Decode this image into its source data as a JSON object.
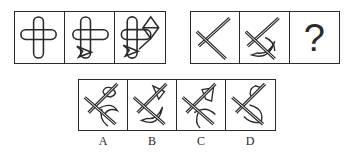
{
  "puzzle": {
    "group1": {
      "cells": [
        {
          "id": "g1-c1",
          "shapes": [
            "cross-capsules"
          ]
        },
        {
          "id": "g1-c2",
          "shapes": [
            "cross-capsules",
            "arrowhead"
          ]
        },
        {
          "id": "g1-c3",
          "shapes": [
            "cross-capsules",
            "arrowhead",
            "diamond-kite"
          ]
        }
      ]
    },
    "group2": {
      "cells": [
        {
          "id": "g2-c1",
          "shapes": [
            "x-cross"
          ]
        },
        {
          "id": "g2-c2",
          "shapes": [
            "x-cross",
            "crescent"
          ]
        },
        {
          "id": "g2-c3",
          "question_mark": "?"
        }
      ]
    },
    "options": [
      {
        "label": "A",
        "shapes": [
          "x-cross",
          "crescent",
          "leaf-flag"
        ]
      },
      {
        "label": "B",
        "shapes": [
          "x-cross",
          "crescent",
          "triangle-flag"
        ]
      },
      {
        "label": "C",
        "shapes": [
          "x-cross",
          "crescent",
          "kite-flag"
        ]
      },
      {
        "label": "D",
        "shapes": [
          "x-cross",
          "crescent",
          "loop-flag"
        ]
      }
    ]
  },
  "colors": {
    "stroke": "#2a2a2a",
    "background": "#ffffff"
  }
}
